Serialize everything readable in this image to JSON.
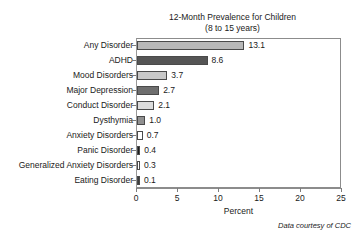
{
  "chart_data": {
    "type": "bar",
    "orientation": "horizontal",
    "title": "12-Month Prevalence for Children",
    "subtitle": "(8 to 15 years)",
    "xlabel": "Percent",
    "ylabel": "",
    "xlim": [
      0,
      25
    ],
    "xticks": [
      0,
      5,
      10,
      15,
      20,
      25
    ],
    "xtick_labels": [
      "0",
      "5",
      "10",
      "15",
      "20",
      "25"
    ],
    "grid": false,
    "legend": "none",
    "annotation": "Data courtesy of CDC",
    "categories": [
      "Any Disorder",
      "ADHD",
      "Mood Disorders",
      "Major Depression",
      "Conduct Disorder",
      "Dysthymia",
      "Anxiety Disorders",
      "Panic Disorder",
      "Generalized Anxiety Disorders",
      "Eating Disorder"
    ],
    "values": [
      13.1,
      8.6,
      3.7,
      2.7,
      2.1,
      1.0,
      0.7,
      0.4,
      0.3,
      0.1
    ],
    "data_labels": [
      "13.1",
      "8.6",
      "3.7",
      "2.7",
      "2.1",
      "1.0",
      "0.7",
      "0.4",
      "0.3",
      "0.1"
    ],
    "bar_colors": [
      "#b8b8b8",
      "#555555",
      "#c8c8c8",
      "#6e6e6e",
      "#dcdcdc",
      "#909090",
      "#ffffff",
      "#1c1c1c",
      "#ffffff",
      "#3c3c3c"
    ],
    "bar_edge_color": "#4a4a4a",
    "axis_color": "#8c8c8c"
  }
}
